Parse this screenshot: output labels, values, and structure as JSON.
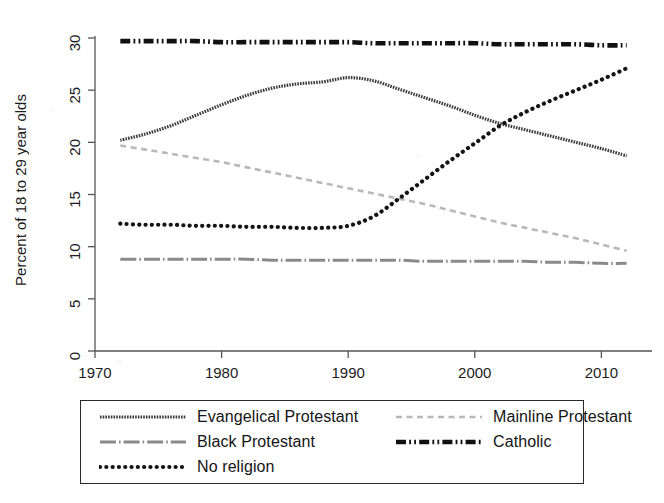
{
  "figure": {
    "background_color": "#ffffff",
    "ink_color": "#1c1c1c"
  },
  "axes": {
    "y_label": "Percent of 18 to 29 year olds",
    "y_ticks": [
      "0",
      "5",
      "10",
      "15",
      "20",
      "25",
      "30"
    ],
    "x_ticks": [
      "1970",
      "1980",
      "1990",
      "2000",
      "2010"
    ]
  },
  "legend": {
    "entries": [
      {
        "label": "Evangelical Protestant",
        "style": "solid-thick",
        "color": "#3c3c3c",
        "key_name": "legend-key-evangelical-protestant"
      },
      {
        "label": "Mainline Protestant",
        "style": "dash-light",
        "color": "#b8b8b8",
        "key_name": "legend-key-mainline-protestant"
      },
      {
        "label": "Black Protestant",
        "style": "dash-dot-gray",
        "color": "#8a8a8a",
        "key_name": "legend-key-black-protestant"
      },
      {
        "label": "Catholic",
        "style": "dash-dot-heavy",
        "color": "#111111",
        "key_name": "legend-key-catholic"
      },
      {
        "label": "No religion",
        "style": "dotted-round",
        "color": "#141414",
        "key_name": "legend-key-no-religion"
      }
    ]
  },
  "chart_data": {
    "type": "line",
    "title": "",
    "xlabel": "",
    "ylabel": "Percent of 18 to 29 year olds",
    "xlim": [
      1970,
      2014
    ],
    "ylim": [
      0,
      30
    ],
    "yticks": [
      0,
      5,
      10,
      15,
      20,
      25,
      30
    ],
    "xticks": [
      1970,
      1980,
      1990,
      2000,
      2010
    ],
    "grid": false,
    "legend_position": "below-axes",
    "x": [
      1972,
      1974,
      1976,
      1978,
      1980,
      1982,
      1984,
      1986,
      1988,
      1990,
      1992,
      1994,
      1996,
      1998,
      2000,
      2002,
      2004,
      2006,
      2008,
      2010,
      2012
    ],
    "series": [
      {
        "name": "Evangelical Protestant",
        "style": "solid-thick",
        "color": "#3c3c3c",
        "values": [
          20.2,
          20.8,
          21.6,
          22.6,
          23.6,
          24.5,
          25.2,
          25.6,
          25.8,
          26.2,
          25.9,
          25.1,
          24.3,
          23.5,
          22.6,
          21.8,
          21.2,
          20.6,
          20.0,
          19.4,
          18.7
        ]
      },
      {
        "name": "Mainline Protestant",
        "style": "dash-light",
        "color": "#b8b8b8",
        "values": [
          19.7,
          19.3,
          18.9,
          18.5,
          18.1,
          17.6,
          17.1,
          16.6,
          16.1,
          15.6,
          15.1,
          14.6,
          14.1,
          13.5,
          12.9,
          12.3,
          11.8,
          11.3,
          10.8,
          10.2,
          9.6
        ]
      },
      {
        "name": "Black Protestant",
        "style": "dash-dot-gray",
        "color": "#8a8a8a",
        "values": [
          8.8,
          8.8,
          8.8,
          8.8,
          8.8,
          8.8,
          8.7,
          8.7,
          8.7,
          8.7,
          8.7,
          8.7,
          8.6,
          8.6,
          8.6,
          8.6,
          8.6,
          8.5,
          8.5,
          8.4,
          8.4
        ]
      },
      {
        "name": "Catholic",
        "style": "dash-dot-heavy",
        "color": "#111111",
        "values": [
          29.7,
          29.7,
          29.7,
          29.7,
          29.6,
          29.6,
          29.6,
          29.6,
          29.6,
          29.6,
          29.5,
          29.5,
          29.5,
          29.5,
          29.5,
          29.4,
          29.4,
          29.4,
          29.4,
          29.3,
          29.3
        ]
      },
      {
        "name": "No religion",
        "style": "dotted-round",
        "color": "#141414",
        "values": [
          12.2,
          12.1,
          12.1,
          12.0,
          12.0,
          11.9,
          11.9,
          11.8,
          11.8,
          12.0,
          12.9,
          14.6,
          16.4,
          18.2,
          19.9,
          21.6,
          22.9,
          24.0,
          25.0,
          26.0,
          27.1
        ]
      }
    ]
  }
}
